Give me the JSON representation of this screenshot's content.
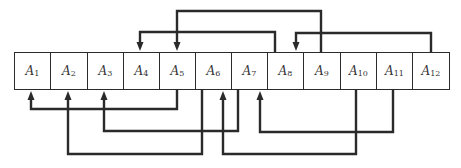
{
  "diagram": {
    "type": "array-permutation-links",
    "cells": [
      {
        "label": "A",
        "sub": "1"
      },
      {
        "label": "A",
        "sub": "2"
      },
      {
        "label": "A",
        "sub": "3"
      },
      {
        "label": "A",
        "sub": "4"
      },
      {
        "label": "A",
        "sub": "5"
      },
      {
        "label": "A",
        "sub": "6"
      },
      {
        "label": "A",
        "sub": "7"
      },
      {
        "label": "A",
        "sub": "8"
      },
      {
        "label": "A",
        "sub": "9"
      },
      {
        "label": "A",
        "sub": "10"
      },
      {
        "label": "A",
        "sub": "11"
      },
      {
        "label": "A",
        "sub": "12"
      }
    ],
    "top_links": [
      {
        "from": "A7",
        "to": "A4"
      },
      {
        "from": "A9",
        "to": "A5"
      },
      {
        "from": "A12",
        "to": "A8"
      }
    ],
    "bottom_links": [
      {
        "from": "A5",
        "to": "A1"
      },
      {
        "from": "A6",
        "to": "A2"
      },
      {
        "from": "A7",
        "to": "A3"
      },
      {
        "from": "A10",
        "to": "A6"
      },
      {
        "from": "A11",
        "to": "A7"
      }
    ],
    "colors": {
      "line": "#2a2a2a",
      "cell_border": "#2b2b2b",
      "background": "#ffffff"
    }
  }
}
